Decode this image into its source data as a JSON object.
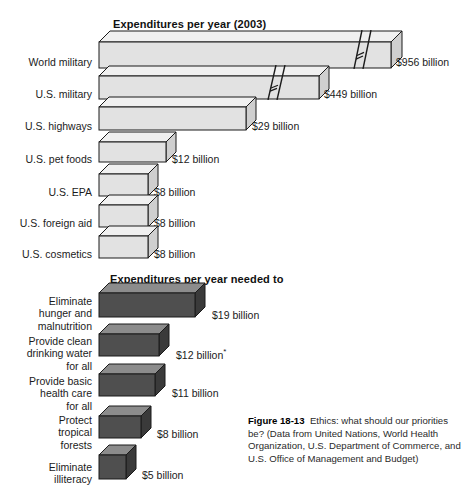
{
  "figure": {
    "caption_label": "Figure 18-13",
    "caption_text": "Ethics: what should our priorities be? (Data from United Nations, World Health Organization, U.S. Department of Commerce, and U.S. Office of Management and Budget)"
  },
  "colors": {
    "top_bar_front": "#e2e2e2",
    "top_bar_top": "#f0f0f0",
    "top_bar_side": "#cfcfcf",
    "bottom_bar_front": "#4f4f4f",
    "bottom_bar_top": "#8c8c8c",
    "bottom_bar_side": "#3a3a3a",
    "outline": "#1b1b1b",
    "text": "#1b1b1b"
  },
  "chart_data": [
    {
      "type": "bar",
      "title": "Expenditures per year (2003)",
      "xlabel": "",
      "ylabel": "",
      "orientation": "horizontal",
      "unit": "billion USD",
      "grid": false,
      "legend": "none",
      "axis_break": true,
      "categories": [
        "World military",
        "U.S. military",
        "U.S. highways",
        "U.S. pet foods",
        "U.S. EPA",
        "U.S. foreign aid",
        "U.S. cosmetics"
      ],
      "values": [
        956,
        449,
        29,
        12,
        8,
        8,
        8
      ],
      "value_labels": [
        "$956 billion",
        "$449 billion",
        "$29 billion",
        "$12 billion",
        "$8 billion",
        "$8 billion",
        "$8 billion"
      ],
      "broken_bars": [
        "World military",
        "U.S. military"
      ]
    },
    {
      "type": "bar",
      "title": "Expenditures per year needed to",
      "xlabel": "",
      "ylabel": "",
      "orientation": "horizontal",
      "unit": "billion USD",
      "grid": false,
      "legend": "none",
      "axis_break": false,
      "categories": [
        "Eliminate hunger and malnutrition",
        "Provide clean drinking water for all",
        "Provide basic health care for all",
        "Protect tropical forests",
        "Eliminate illiteracy"
      ],
      "values": [
        19,
        12,
        11,
        8,
        5
      ],
      "value_labels": [
        "$19 billion",
        "$12 billion",
        "$11 billion",
        "$8 billion",
        "$5 billion"
      ],
      "footnote_marker_on": "Provide clean drinking water for all"
    }
  ],
  "top_chart": {
    "title": "Expenditures per year (2003)",
    "rows": [
      {
        "label": "World military",
        "value_label": "$956 billion",
        "label_top": 56,
        "bar_top": 42,
        "bar_len": 292,
        "bar_h": 26,
        "depth": 11,
        "label_x": 396,
        "label_y": 56,
        "break_at": 258,
        "label_lines": 1
      },
      {
        "label": "U.S. military",
        "value_label": "$449 billion",
        "label_top": 88,
        "bar_top": 76,
        "bar_len": 220,
        "bar_h": 23,
        "depth": 10,
        "label_x": 324,
        "label_y": 88,
        "break_at": 172,
        "label_lines": 1
      },
      {
        "label": "U.S. highways",
        "value_label": "$29 billion",
        "label_top": 120,
        "bar_top": 107,
        "bar_len": 147,
        "bar_h": 23,
        "depth": 10,
        "label_x": 252,
        "label_y": 120,
        "break_at": 0,
        "label_lines": 1
      },
      {
        "label": "U.S. pet foods",
        "value_label": "$12 billion",
        "label_top": 153,
        "bar_top": 142,
        "bar_len": 67,
        "bar_h": 20,
        "depth": 10,
        "label_x": 172,
        "label_y": 153,
        "break_at": 0,
        "label_lines": 1
      },
      {
        "label": "U.S. EPA",
        "value_label": "$8 billion",
        "label_top": 186,
        "bar_top": 174,
        "bar_len": 49,
        "bar_h": 22,
        "depth": 10,
        "label_x": 154,
        "label_y": 186,
        "break_at": 0,
        "label_lines": 1
      },
      {
        "label": "U.S. foreign aid",
        "value_label": "$8 billion",
        "label_top": 217,
        "bar_top": 205,
        "bar_len": 49,
        "bar_h": 22,
        "depth": 10,
        "label_x": 154,
        "label_y": 217,
        "break_at": 0,
        "label_lines": 1
      },
      {
        "label": "U.S. cosmetics",
        "value_label": "$8 billion",
        "label_top": 248,
        "bar_top": 236,
        "bar_len": 49,
        "bar_h": 22,
        "depth": 10,
        "label_x": 154,
        "label_y": 248,
        "break_at": 0,
        "label_lines": 1
      }
    ]
  },
  "bottom_chart": {
    "title": "Expenditures per year needed to",
    "rows": [
      {
        "label": "Eliminate\nhunger and\nmalnutrition",
        "value_label": "$19 billion",
        "asterisk": "",
        "label_top": 295,
        "bar_top": 293,
        "bar_len": 96,
        "bar_h": 24,
        "depth": 10,
        "label_x": 212,
        "label_y": 309
      },
      {
        "label": "Provide clean\ndrinking water\nfor all",
        "value_label": "$12 billion",
        "asterisk": "*",
        "label_top": 335,
        "bar_top": 334,
        "bar_len": 60,
        "bar_h": 22,
        "depth": 10,
        "label_x": 176,
        "label_y": 347
      },
      {
        "label": "Provide basic\nhealth care\nfor all",
        "value_label": "$11 billion",
        "asterisk": "",
        "label_top": 375,
        "bar_top": 374,
        "bar_len": 56,
        "bar_h": 22,
        "depth": 10,
        "label_x": 172,
        "label_y": 387
      },
      {
        "label": "Protect\ntropical\nforests",
        "value_label": "$8 billion",
        "asterisk": "",
        "label_top": 414,
        "bar_top": 416,
        "bar_len": 42,
        "bar_h": 22,
        "depth": 10,
        "label_x": 157,
        "label_y": 428
      },
      {
        "label": "Eliminate\nilliteracy",
        "value_label": "$5 billion",
        "asterisk": "",
        "label_top": 461,
        "bar_top": 455,
        "bar_len": 27,
        "bar_h": 24,
        "depth": 10,
        "label_x": 142,
        "label_y": 469
      }
    ]
  }
}
